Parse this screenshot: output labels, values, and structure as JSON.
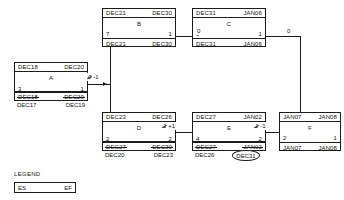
{
  "diagram": {
    "type": "precedence-network-diagram",
    "title": "",
    "accent_color": "#1b1b1b",
    "background_color": "#ffffff"
  },
  "nodes": [
    {
      "id": "A",
      "name": "A",
      "early_start": "DEC18",
      "early_finish": "DEC20",
      "duration": "3",
      "float": "1",
      "late_start_struck": "DEC18",
      "late_finish_struck": "DEC20",
      "late_start_revised": "DEC17",
      "late_finish_revised": "DEC19"
    },
    {
      "id": "B",
      "name": "B",
      "early_start": "DEC21",
      "early_finish": "DEC30",
      "duration": "7",
      "float": "1",
      "late_start": "DEC21",
      "late_finish": "DEC30"
    },
    {
      "id": "C",
      "name": "C",
      "early_start": "DEC31",
      "early_finish": "JAN06",
      "duration": "5",
      "float": "1",
      "late_start": "DEC31",
      "late_finish": "JAN06"
    },
    {
      "id": "D",
      "name": "D",
      "early_start": "DEC23",
      "early_finish": "DEC26",
      "duration": "2",
      "float": "2",
      "late_start_struck": "DEC27",
      "late_finish_struck": "DEC30",
      "late_start_revised": "DEC20",
      "late_finish_revised": "DEC23"
    },
    {
      "id": "E",
      "name": "E",
      "early_start": "DEC27",
      "early_finish": "JAN02",
      "duration": "4",
      "float": "2",
      "late_start_struck": "DEC27",
      "late_finish_struck": "JAN02",
      "late_start_revised": "DEC26",
      "late_finish_revised_circled": "DEC31"
    },
    {
      "id": "F",
      "name": "F",
      "early_start": "JAN07",
      "early_finish": "JAN08",
      "duration": "2",
      "float": "1",
      "late_start": "JAN07",
      "late_finish": "JAN08"
    }
  ],
  "links": [
    {
      "id": "a-to-b",
      "from": "A",
      "to": "B",
      "lag_struck": "0",
      "lag_revised": "-1"
    },
    {
      "id": "b-to-c",
      "from": "B",
      "to": "C",
      "lag": "0"
    },
    {
      "id": "c-to-f",
      "from": "C",
      "to": "F",
      "lag": "0"
    },
    {
      "id": "d-to-e",
      "from": "D",
      "to": "E",
      "lag_struck": "1",
      "lag_revised": "+1"
    },
    {
      "id": "e-to-f",
      "from": "E",
      "to": "F",
      "lag_struck": "1",
      "lag_revised": "-1"
    }
  ],
  "legend": {
    "title": "LEGEND",
    "early_start_label": "ES",
    "early_finish_label": "EF"
  }
}
